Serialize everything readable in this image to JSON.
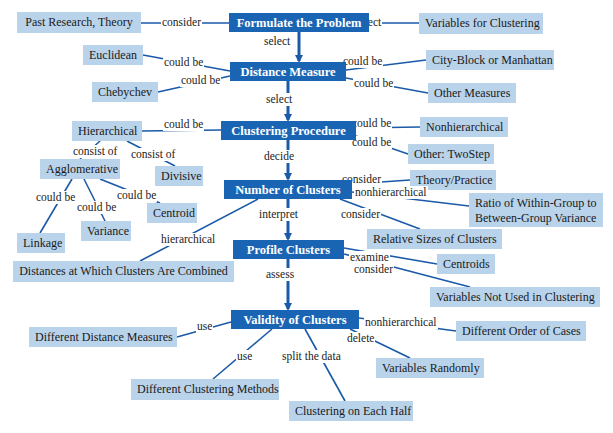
{
  "colors": {
    "main_node": "#1a64b4",
    "leaf_node": "#b9d3ea",
    "connector": "#1a5aa8",
    "text": "#1a1a1a"
  },
  "main_nodes": [
    {
      "id": "formulate",
      "label": "Formulate the Problem",
      "x": 229,
      "y": 13,
      "w": 140,
      "h": 19
    },
    {
      "id": "distance",
      "label": "Distance Measure",
      "x": 230,
      "y": 62,
      "w": 116,
      "h": 19
    },
    {
      "id": "procedure",
      "label": "Clustering Procedure",
      "x": 221,
      "y": 121,
      "w": 135,
      "h": 19
    },
    {
      "id": "number",
      "label": "Number of Clusters",
      "x": 224,
      "y": 180,
      "w": 128,
      "h": 19
    },
    {
      "id": "profile",
      "label": "Profile Clusters",
      "x": 233,
      "y": 240,
      "w": 111,
      "h": 19
    },
    {
      "id": "validity",
      "label": "Validity of Clusters",
      "x": 231,
      "y": 310,
      "w": 128,
      "h": 19
    }
  ],
  "flow_labels": [
    {
      "text": "select",
      "x": 263,
      "y": 35
    },
    {
      "text": "select",
      "x": 265,
      "y": 93
    },
    {
      "text": "decide",
      "x": 263,
      "y": 150
    },
    {
      "text": "interpret",
      "x": 258,
      "y": 208
    },
    {
      "text": "assess",
      "x": 265,
      "y": 268
    }
  ],
  "leaf_nodes": [
    {
      "id": "past",
      "label": "Past Research, Theory",
      "x": 17,
      "y": 12,
      "w": 124,
      "h": 21
    },
    {
      "id": "variables",
      "label": "Variables for Clustering",
      "x": 419,
      "y": 13,
      "w": 124,
      "h": 21
    },
    {
      "id": "euclidean",
      "label": "Euclidean",
      "x": 83,
      "y": 45,
      "w": 60,
      "h": 20
    },
    {
      "id": "cityblock",
      "label": "City-Block or Manhattan",
      "x": 426,
      "y": 50,
      "w": 128,
      "h": 20
    },
    {
      "id": "chebychev",
      "label": "Chebychev",
      "x": 92,
      "y": 82,
      "w": 66,
      "h": 20
    },
    {
      "id": "othermeasures",
      "label": "Other Measures",
      "x": 428,
      "y": 83,
      "w": 88,
      "h": 20
    },
    {
      "id": "hierarchical",
      "label": "Hierarchical",
      "x": 72,
      "y": 121,
      "w": 70,
      "h": 20
    },
    {
      "id": "nonhierarchical",
      "label": "Nonhierarchical",
      "x": 420,
      "y": 117,
      "w": 88,
      "h": 20
    },
    {
      "id": "agglomerative",
      "label": "Agglomerative",
      "x": 40,
      "y": 159,
      "w": 80,
      "h": 20
    },
    {
      "id": "divisive",
      "label": "Divisive",
      "x": 155,
      "y": 166,
      "w": 48,
      "h": 20
    },
    {
      "id": "othertwostep",
      "label": "Other: TwoStep",
      "x": 408,
      "y": 144,
      "w": 86,
      "h": 20
    },
    {
      "id": "theory",
      "label": "Theory/Practice",
      "x": 410,
      "y": 170,
      "w": 86,
      "h": 20
    },
    {
      "id": "ratio",
      "label": "Ratio of Within-Group to Between-Group Variance",
      "x": 469,
      "y": 193,
      "w": 134,
      "h": 34,
      "multi": true
    },
    {
      "id": "centroid",
      "label": "Centroid",
      "x": 147,
      "y": 203,
      "w": 50,
      "h": 20
    },
    {
      "id": "variance",
      "label": "Variance",
      "x": 81,
      "y": 221,
      "w": 50,
      "h": 20
    },
    {
      "id": "linkage",
      "label": "Linkage",
      "x": 17,
      "y": 233,
      "w": 48,
      "h": 20
    },
    {
      "id": "relsizes",
      "label": "Relative Sizes of Clusters",
      "x": 367,
      "y": 229,
      "w": 135,
      "h": 20
    },
    {
      "id": "distances",
      "label": "Distances at Which Clusters Are Combined",
      "x": 13,
      "y": 261,
      "w": 221,
      "h": 21
    },
    {
      "id": "centroids",
      "label": "Centroids",
      "x": 437,
      "y": 254,
      "w": 58,
      "h": 20
    },
    {
      "id": "notused",
      "label": "Variables Not Used in Clustering",
      "x": 430,
      "y": 287,
      "w": 170,
      "h": 20
    },
    {
      "id": "diffdist",
      "label": "Different Distance Measures",
      "x": 29,
      "y": 327,
      "w": 148,
      "h": 20
    },
    {
      "id": "diffcases",
      "label": "Different Order of Cases",
      "x": 456,
      "y": 321,
      "w": 130,
      "h": 20
    },
    {
      "id": "varrandom",
      "label": "Variables Randomly",
      "x": 376,
      "y": 358,
      "w": 108,
      "h": 20
    },
    {
      "id": "diffmethods",
      "label": "Different Clustering Methods",
      "x": 131,
      "y": 379,
      "w": 148,
      "h": 21
    },
    {
      "id": "eachhalf",
      "label": "Clustering on Each Half",
      "x": 289,
      "y": 401,
      "w": 124,
      "h": 20
    }
  ],
  "edge_labels": [
    {
      "text": "consider",
      "x": 161,
      "y": 16
    },
    {
      "text": "select",
      "x": 354,
      "y": 16
    },
    {
      "text": "could be",
      "x": 163,
      "y": 56
    },
    {
      "text": "could be",
      "x": 180,
      "y": 74
    },
    {
      "text": "could be",
      "x": 342,
      "y": 55
    },
    {
      "text": "could be",
      "x": 353,
      "y": 77
    },
    {
      "text": "could be",
      "x": 163,
      "y": 118
    },
    {
      "text": "could be",
      "x": 351,
      "y": 117
    },
    {
      "text": "consist of",
      "x": 72,
      "y": 145
    },
    {
      "text": "consist of",
      "x": 130,
      "y": 148
    },
    {
      "text": "could be",
      "x": 351,
      "y": 136
    },
    {
      "text": "consider",
      "x": 341,
      "y": 173
    },
    {
      "text": "nonhierarchical",
      "x": 354,
      "y": 186
    },
    {
      "text": "could be",
      "x": 35,
      "y": 191
    },
    {
      "text": "could be",
      "x": 116,
      "y": 189
    },
    {
      "text": "could be",
      "x": 76,
      "y": 201
    },
    {
      "text": "consider",
      "x": 340,
      "y": 208
    },
    {
      "text": "hierarchical",
      "x": 160,
      "y": 233
    },
    {
      "text": "examine",
      "x": 349,
      "y": 251
    },
    {
      "text": "consider",
      "x": 353,
      "y": 263
    },
    {
      "text": "use",
      "x": 196,
      "y": 320
    },
    {
      "text": "nonhierarchical",
      "x": 364,
      "y": 316
    },
    {
      "text": "delete",
      "x": 346,
      "y": 332
    },
    {
      "text": "use",
      "x": 236,
      "y": 350
    },
    {
      "text": "split the data",
      "x": 281,
      "y": 350
    }
  ],
  "edges": [
    [
      141,
      23,
      229,
      23
    ],
    [
      369,
      23,
      419,
      23
    ],
    [
      143,
      55,
      230,
      71
    ],
    [
      158,
      92,
      230,
      76
    ],
    [
      346,
      70,
      426,
      60
    ],
    [
      346,
      78,
      428,
      93
    ],
    [
      142,
      131,
      221,
      130
    ],
    [
      356,
      128,
      420,
      127
    ],
    [
      356,
      136,
      408,
      154
    ],
    [
      100,
      141,
      80,
      159
    ],
    [
      127,
      141,
      175,
      166
    ],
    [
      72,
      179,
      40,
      233
    ],
    [
      84,
      179,
      105,
      221
    ],
    [
      100,
      179,
      160,
      203
    ],
    [
      352,
      184,
      410,
      180
    ],
    [
      352,
      192,
      469,
      206
    ],
    [
      340,
      199,
      420,
      229
    ],
    [
      258,
      199,
      140,
      261
    ],
    [
      344,
      248,
      437,
      264
    ],
    [
      344,
      254,
      470,
      287
    ],
    [
      231,
      322,
      177,
      337
    ],
    [
      359,
      318,
      456,
      331
    ],
    [
      350,
      329,
      410,
      358
    ],
    [
      272,
      329,
      213,
      379
    ],
    [
      305,
      329,
      345,
      401
    ]
  ],
  "arrows": [
    [
      299,
      32,
      299,
      62
    ],
    [
      288,
      81,
      288,
      121
    ],
    [
      288,
      140,
      288,
      180
    ],
    [
      288,
      199,
      288,
      240
    ],
    [
      288,
      259,
      288,
      310
    ]
  ]
}
